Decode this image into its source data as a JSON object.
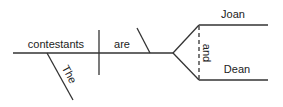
{
  "diagram": {
    "type": "sentence-diagram",
    "line_color": "#333333",
    "words": {
      "subject": "contestants",
      "verb": "are",
      "modifier": "The",
      "predicate_1": "Joan",
      "predicate_2": "Dean",
      "conjunction": "and"
    }
  }
}
